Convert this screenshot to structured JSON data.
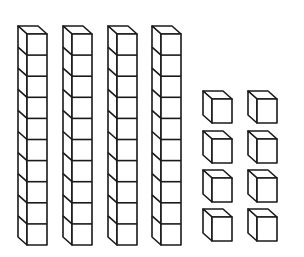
{
  "diagram": {
    "title": "Base-ten blocks",
    "stroke_color": "#1a1a1a",
    "fill_color": "#ffffff",
    "tens": {
      "count": 4,
      "cubes_per_rod": 10,
      "rods": [
        {
          "x": 18,
          "y": 26
        },
        {
          "x": 63,
          "y": 26
        },
        {
          "x": 108,
          "y": 26
        },
        {
          "x": 152,
          "y": 26
        }
      ]
    },
    "ones": {
      "count": 8,
      "cubes": [
        {
          "x": 203,
          "y": 91
        },
        {
          "x": 248,
          "y": 91
        },
        {
          "x": 203,
          "y": 131
        },
        {
          "x": 248,
          "y": 131
        },
        {
          "x": 203,
          "y": 170
        },
        {
          "x": 248,
          "y": 170
        },
        {
          "x": 203,
          "y": 209
        },
        {
          "x": 248,
          "y": 209
        }
      ]
    },
    "value": 48
  }
}
